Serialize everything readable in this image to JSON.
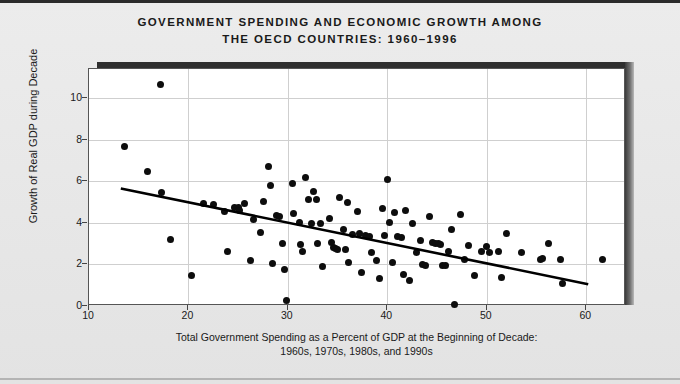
{
  "title": {
    "line1": "GOVERNMENT SPENDING AND ECONOMIC GROWTH AMONG",
    "line2": "THE OECD COUNTRIES: 1960–1996"
  },
  "axes": {
    "y_label": "Growth of Real GDP during Decade",
    "x_label_line1": "Total Government Spending as a Percent of GDP at the Beginning of Decade:",
    "x_label_line2": "1960s, 1970s, 1980s, and 1990s",
    "y_ticks": [
      "0",
      "2",
      "4",
      "6",
      "8",
      "10"
    ],
    "x_ticks": [
      "10",
      "20",
      "30",
      "40",
      "50",
      "60"
    ]
  },
  "colors": {
    "background": "#e9e9e9",
    "plot_background": "#ffffff",
    "marker": "#0d0d0d",
    "trendline": "#000000",
    "gridline": "#cfcfcf",
    "frame": "#555555",
    "shadow": "#2f2f2f"
  },
  "chart_data": {
    "type": "scatter",
    "title": "GOVERNMENT SPENDING AND ECONOMIC GROWTH AMONG THE OECD COUNTRIES: 1960–1996",
    "xlabel": "Total Government Spending as a Percent of GDP at the Beginning of Decade: 1960s, 1970s, 1980s, and 1990s",
    "ylabel": "Growth of Real GDP during Decade",
    "xlim": [
      10,
      64
    ],
    "ylim": [
      0,
      11.4
    ],
    "xticks": [
      10,
      20,
      30,
      40,
      50,
      60
    ],
    "yticks": [
      0,
      2,
      4,
      6,
      8,
      10
    ],
    "grid": true,
    "legend": null,
    "marker_color": "#0d0d0d",
    "marker_size": 7,
    "trendline": {
      "type": "linear-fit",
      "x_start": 13.2,
      "y_start": 5.65,
      "x_end": 60.2,
      "y_end": 1.05,
      "color": "#000000",
      "width": 2.6
    },
    "points": [
      [
        13.6,
        7.65
      ],
      [
        15.9,
        6.45
      ],
      [
        17.2,
        10.65
      ],
      [
        17.3,
        5.45
      ],
      [
        18.2,
        3.2
      ],
      [
        20.3,
        1.45
      ],
      [
        21.5,
        4.95
      ],
      [
        22.5,
        4.9
      ],
      [
        23.6,
        4.55
      ],
      [
        23.9,
        2.6
      ],
      [
        24.6,
        4.75
      ],
      [
        25.0,
        4.75
      ],
      [
        25.1,
        4.6
      ],
      [
        25.6,
        4.95
      ],
      [
        26.2,
        2.2
      ],
      [
        26.5,
        4.15
      ],
      [
        27.2,
        3.55
      ],
      [
        27.5,
        5.05
      ],
      [
        28.0,
        6.7
      ],
      [
        28.3,
        5.8
      ],
      [
        28.5,
        2.05
      ],
      [
        28.9,
        4.35
      ],
      [
        29.2,
        4.3
      ],
      [
        29.5,
        3.0
      ],
      [
        29.7,
        1.75
      ],
      [
        29.9,
        0.25
      ],
      [
        30.5,
        5.9
      ],
      [
        30.6,
        4.45
      ],
      [
        31.2,
        4.0
      ],
      [
        31.3,
        2.95
      ],
      [
        31.5,
        2.6
      ],
      [
        31.8,
        6.2
      ],
      [
        32.1,
        5.1
      ],
      [
        32.4,
        3.95
      ],
      [
        32.6,
        5.5
      ],
      [
        32.9,
        5.1
      ],
      [
        33.0,
        3.0
      ],
      [
        33.3,
        3.95
      ],
      [
        33.5,
        1.9
      ],
      [
        34.2,
        4.2
      ],
      [
        34.4,
        3.05
      ],
      [
        34.6,
        2.8
      ],
      [
        34.8,
        2.75
      ],
      [
        35.0,
        2.7
      ],
      [
        35.2,
        5.2
      ],
      [
        35.6,
        3.7
      ],
      [
        35.8,
        2.7
      ],
      [
        36.0,
        5.0
      ],
      [
        36.1,
        2.1
      ],
      [
        36.5,
        3.45
      ],
      [
        37.0,
        4.55
      ],
      [
        37.2,
        3.5
      ],
      [
        37.4,
        1.6
      ],
      [
        37.8,
        3.4
      ],
      [
        38.2,
        3.35
      ],
      [
        38.4,
        2.55
      ],
      [
        38.9,
        2.2
      ],
      [
        39.2,
        1.3
      ],
      [
        39.5,
        4.7
      ],
      [
        39.7,
        3.4
      ],
      [
        40.0,
        6.1
      ],
      [
        40.2,
        4.0
      ],
      [
        40.5,
        2.1
      ],
      [
        40.7,
        4.5
      ],
      [
        41.0,
        3.35
      ],
      [
        41.4,
        3.3
      ],
      [
        41.6,
        1.5
      ],
      [
        41.8,
        4.6
      ],
      [
        42.2,
        1.25
      ],
      [
        42.5,
        3.95
      ],
      [
        42.9,
        2.55
      ],
      [
        43.3,
        3.15
      ],
      [
        43.5,
        2.0
      ],
      [
        43.8,
        1.95
      ],
      [
        44.2,
        4.3
      ],
      [
        44.5,
        3.05
      ],
      [
        44.8,
        3.0
      ],
      [
        45.1,
        3.0
      ],
      [
        45.3,
        2.95
      ],
      [
        45.5,
        1.95
      ],
      [
        45.8,
        1.95
      ],
      [
        46.2,
        2.6
      ],
      [
        46.5,
        3.7
      ],
      [
        46.8,
        0.05
      ],
      [
        47.4,
        4.4
      ],
      [
        47.8,
        2.25
      ],
      [
        48.2,
        2.9
      ],
      [
        48.8,
        1.45
      ],
      [
        49.5,
        2.6
      ],
      [
        50.0,
        2.85
      ],
      [
        50.3,
        2.55
      ],
      [
        51.2,
        2.6
      ],
      [
        51.5,
        1.35
      ],
      [
        52.0,
        3.5
      ],
      [
        53.5,
        2.55
      ],
      [
        55.4,
        2.25
      ],
      [
        55.6,
        2.3
      ],
      [
        56.2,
        3.0
      ],
      [
        57.4,
        2.25
      ],
      [
        57.6,
        1.1
      ],
      [
        61.6,
        2.25
      ]
    ]
  }
}
